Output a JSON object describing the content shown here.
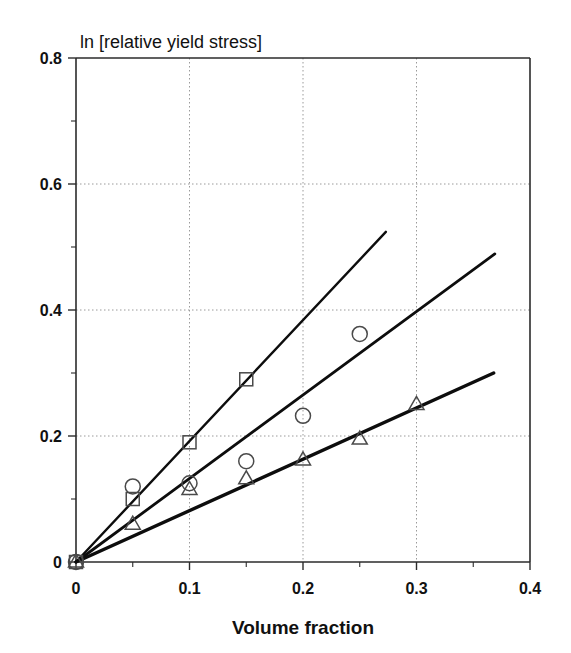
{
  "chart_data": {
    "type": "scatter",
    "title": "ln [relative yield stress]",
    "xlabel": "Volume fraction",
    "ylabel": "ln [relative yield stress]",
    "xlim": [
      0,
      0.4
    ],
    "ylim": [
      0,
      0.8
    ],
    "xticks": [
      "0",
      "0.1",
      "0.2",
      "0.3",
      "0.4"
    ],
    "xtick_values": [
      0,
      0.1,
      0.2,
      0.3,
      0.4
    ],
    "yticks": [
      "0",
      "0.2",
      "0.4",
      "0.6",
      "0.8"
    ],
    "ytick_values": [
      0,
      0.2,
      0.4,
      0.6,
      0.8
    ],
    "x_minor_ticks": [
      0.05,
      0.15,
      0.25,
      0.35
    ],
    "y_minor_ticks": [
      0.1,
      0.3,
      0.5,
      0.7
    ],
    "grid": "dotted gridlines at major ticks",
    "legend": "none",
    "series": [
      {
        "name": "circle-series",
        "marker": "circle",
        "x": [
          0,
          0.05,
          0.1,
          0.15,
          0.2,
          0.25
        ],
        "values": [
          0,
          0.12,
          0.125,
          0.16,
          0.232,
          0.362
        ]
      },
      {
        "name": "square-series",
        "marker": "square",
        "x": [
          0,
          0.05,
          0.1,
          0.15
        ],
        "values": [
          0,
          0.1,
          0.19,
          0.29
        ]
      },
      {
        "name": "triangle-series",
        "marker": "triangle",
        "x": [
          0,
          0.05,
          0.1,
          0.15,
          0.2,
          0.25,
          0.3
        ],
        "values": [
          0,
          0.06,
          0.115,
          0.132,
          0.162,
          0.195,
          0.25
        ]
      }
    ],
    "fit_lines": [
      {
        "name": "steep-fit-line",
        "x": [
          0,
          0.273
        ],
        "y": [
          0,
          0.524
        ],
        "slope": 1.92,
        "intercept": 0,
        "stroke_width": 2.4
      },
      {
        "name": "middle-fit-line",
        "x": [
          0,
          0.369
        ],
        "y": [
          0,
          0.489
        ],
        "slope": 1.325,
        "intercept": 0,
        "stroke_width": 2.8
      },
      {
        "name": "shallow-fit-line",
        "x": [
          0,
          0.368
        ],
        "y": [
          0,
          0.3
        ],
        "slope": 0.815,
        "intercept": 0,
        "stroke_width": 3.4
      }
    ],
    "colors": {
      "line": "#0d0d0d",
      "marker_stroke": "#4a4a4a",
      "frame": "#2b2b2b",
      "grid": "#9a9a9a",
      "text": "#111111",
      "background": "#ffffff"
    }
  }
}
